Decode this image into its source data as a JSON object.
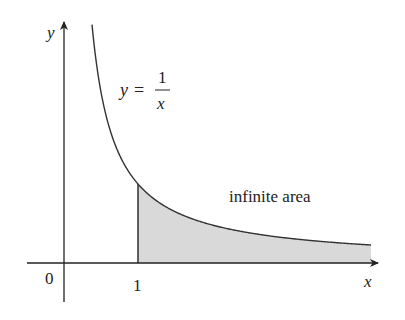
{
  "chart_data": {
    "type": "area",
    "title": "",
    "function": "y = 1/x",
    "xlabel": "x",
    "ylabel": "y",
    "x_ticks": [
      {
        "value": 0,
        "label": "0"
      },
      {
        "value": 1,
        "label": "1"
      }
    ],
    "curve_label": {
      "lhs": "y =",
      "numerator": "1",
      "denominator": "x"
    },
    "shaded_region": {
      "from_x": 1,
      "to_x": "infinity",
      "label": "infinite area"
    },
    "x_range_shown": [
      0,
      4.2
    ],
    "grid": false,
    "legend": false,
    "colors": {
      "axis": "#222222",
      "curve": "#333333",
      "shade": "#d9d9d9"
    },
    "sample_points": [
      {
        "x": 0.38,
        "y": 2.6
      },
      {
        "x": 0.5,
        "y": 2.0
      },
      {
        "x": 1,
        "y": 1
      },
      {
        "x": 2,
        "y": 0.5
      },
      {
        "x": 3,
        "y": 0.333
      },
      {
        "x": 4,
        "y": 0.25
      }
    ]
  },
  "labels": {
    "y_axis": "y",
    "x_axis": "x",
    "origin": "0",
    "tick_one": "1",
    "eq_lhs": "y =",
    "eq_num": "1",
    "eq_den": "x",
    "area": "infinite area"
  }
}
